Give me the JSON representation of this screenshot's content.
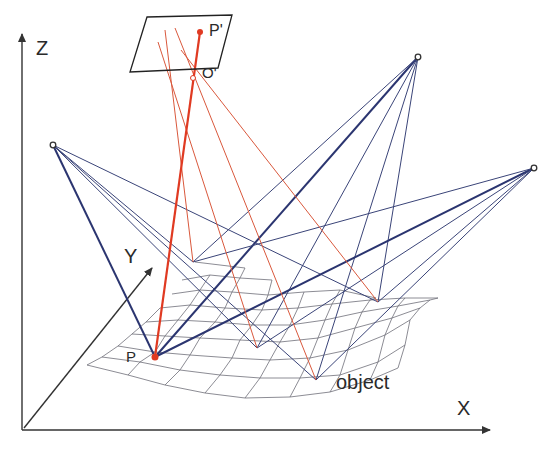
{
  "diagram": {
    "type": "photogrammetry-multi-camera-triangulation",
    "labels": {
      "z_axis": "Z",
      "y_axis": "Y",
      "x_axis": "X",
      "image_point": "P'",
      "projection_center": "O'",
      "object_point": "P",
      "object": "object"
    },
    "colors": {
      "axis": "#333333",
      "camera_rays": "#3a4478",
      "camera_rays_bold": "#2b3570",
      "projection_rays": "#d9583c",
      "main_ray": "#e03a22",
      "mesh": "#6e6e78",
      "point": "#e03a22",
      "image_plane": "#222222"
    },
    "cameras": [
      {
        "name": "camera-left",
        "x": 53,
        "y": 145
      },
      {
        "name": "camera-top-right",
        "x": 418,
        "y": 57
      },
      {
        "name": "camera-right",
        "x": 534,
        "y": 168
      }
    ]
  }
}
